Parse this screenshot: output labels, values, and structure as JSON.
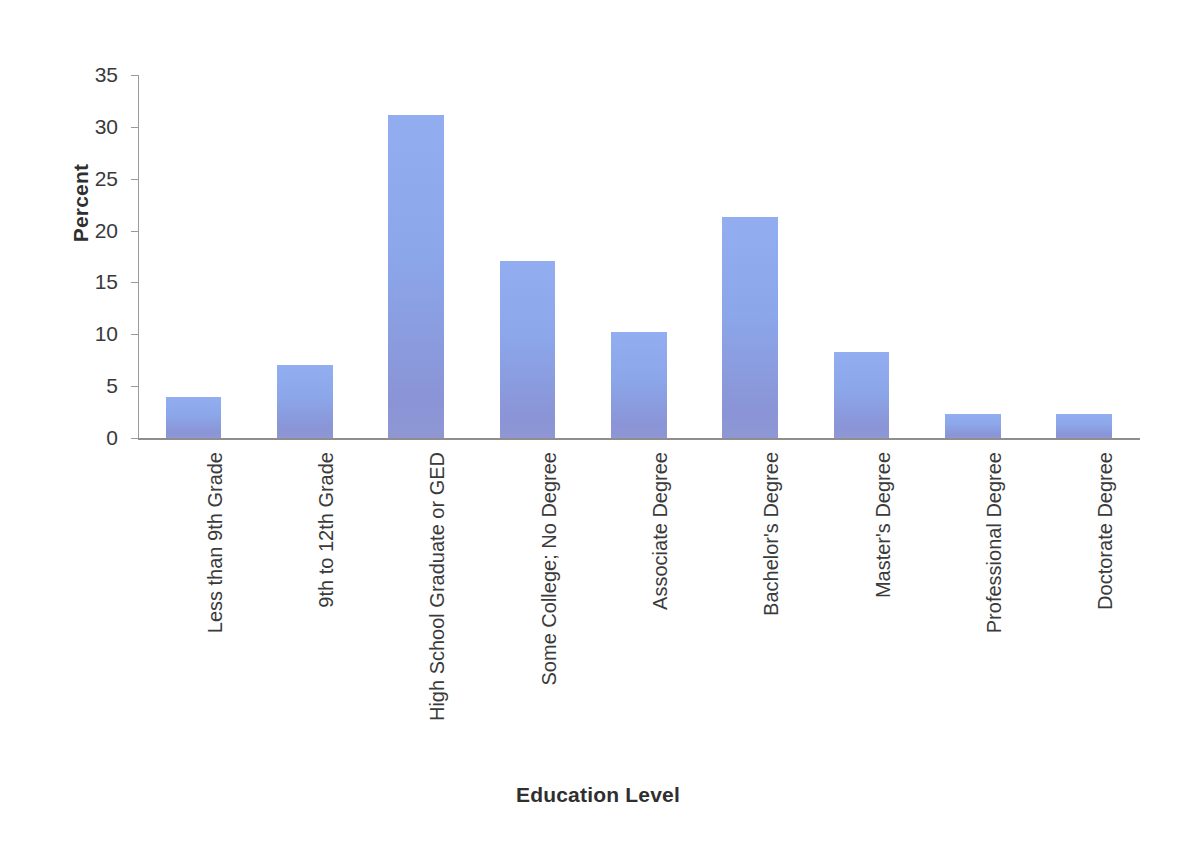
{
  "chart_data": {
    "type": "bar",
    "title": "",
    "subtitle": "",
    "xlabel": "Education Level",
    "ylabel": "Percent",
    "categories": [
      "Less than 9th Grade",
      "9th to 12th Grade",
      "High School Graduate or GED",
      "Some College; No Degree",
      "Associate Degree",
      "Bachelor's Degree",
      "Master's Degree",
      "Professional Degree",
      "Doctorate Degree"
    ],
    "values": [
      4.0,
      7.0,
      31.1,
      17.1,
      10.2,
      21.3,
      8.3,
      2.3,
      2.3
    ],
    "ylim": [
      0,
      35
    ],
    "yticks": [
      0,
      5,
      10,
      15,
      20,
      25,
      30,
      35
    ],
    "ytick_labels": [
      "0",
      "5",
      "10",
      "15",
      "20",
      "25",
      "30",
      "35"
    ],
    "grid": false,
    "legend": false,
    "legend_position": "none",
    "bar_color_top": "#92AEF0",
    "bar_color_bottom": "#8A94D6",
    "axis_color": "#8E8E8E",
    "text_color": "#3A3A3A",
    "background": "#FFFFFF",
    "xtick_rotation": -90
  }
}
